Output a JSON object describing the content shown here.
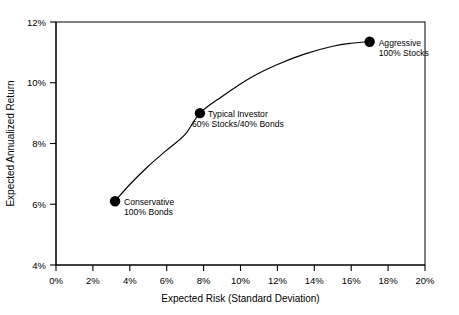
{
  "chart_data": {
    "type": "line",
    "title": "",
    "xlabel": "Expected Risk (Standard Deviation)",
    "ylabel": "Expected Annualized Return",
    "xlim": [
      0,
      20
    ],
    "ylim": [
      4,
      12
    ],
    "grid": false,
    "legend": "none",
    "x_tick_labels": [
      "0%",
      "2%",
      "4%",
      "6%",
      "8%",
      "10%",
      "12%",
      "14%",
      "16%",
      "18%",
      "20%"
    ],
    "x_tick_values": [
      0,
      2,
      4,
      6,
      8,
      10,
      12,
      14,
      16,
      18,
      20
    ],
    "y_tick_labels": [
      "4%",
      "6%",
      "8%",
      "10%",
      "12%"
    ],
    "y_tick_values": [
      4,
      6,
      8,
      10,
      12
    ],
    "series": [
      {
        "name": "Efficient Frontier",
        "x": [
          3.2,
          4.0,
          5.0,
          6.0,
          7.0,
          7.8,
          9.0,
          10.5,
          12.0,
          13.5,
          15.0,
          16.0,
          17.0
        ],
        "y": [
          6.1,
          6.65,
          7.25,
          7.78,
          8.3,
          9.0,
          9.55,
          10.15,
          10.6,
          10.95,
          11.2,
          11.3,
          11.35
        ]
      }
    ],
    "points": [
      {
        "name": "Conservative",
        "x": 3.2,
        "y": 6.1,
        "label_line1": "Conservative",
        "label_line2": "100% Bonds",
        "label_anchor": "start"
      },
      {
        "name": "Typical Investor",
        "x": 7.8,
        "y": 9.0,
        "label_line1": "Typical Investor",
        "label_line2": "60% Stocks/40% Bonds",
        "label_anchor": "middle"
      },
      {
        "name": "Aggressive",
        "x": 17.0,
        "y": 11.35,
        "label_line1": "Aggressive",
        "label_line2": "100% Stocks",
        "label_anchor": "start"
      }
    ],
    "colors": {
      "axis": "#000000",
      "curve": "#000000",
      "marker": "#000000",
      "background": "#ffffff"
    }
  }
}
